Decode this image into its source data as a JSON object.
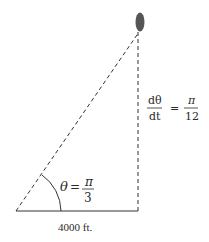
{
  "diagram": {
    "type": "related-rates-triangle",
    "colors": {
      "line": "#333333",
      "balloon": "#555555",
      "text": "#2a2a2a"
    },
    "angle_label": {
      "symbol": "θ",
      "equals": "=",
      "numerator": "π",
      "denominator": "3"
    },
    "rate_label": {
      "lhs_numerator": "dθ",
      "lhs_denominator": "dt",
      "equals": "=",
      "rhs_numerator": "π",
      "rhs_denominator": "12"
    },
    "base_label": "4000 ft."
  }
}
